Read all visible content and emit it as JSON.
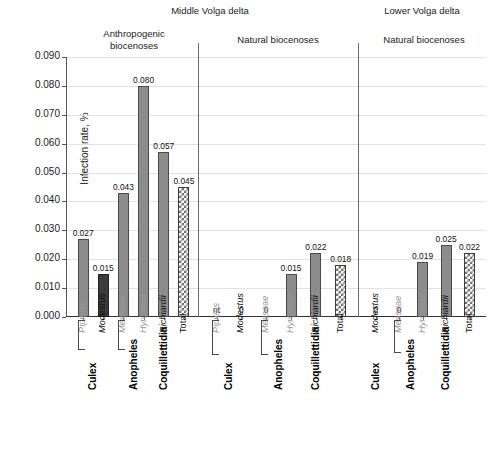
{
  "chart_data": {
    "type": "bar",
    "title": "",
    "xlabel": "",
    "ylabel": "Infection rate, %",
    "ylim": [
      0.0,
      0.09
    ],
    "ytick_labels": [
      "0.000",
      "0.010",
      "0.020",
      "0.030",
      "0.040",
      "0.050",
      "0.060",
      "0.070",
      "0.080",
      "0.090"
    ],
    "ytick_values": [
      0.0,
      0.01,
      0.02,
      0.03,
      0.04,
      0.05,
      0.06,
      0.07,
      0.08,
      0.09
    ],
    "grid": true,
    "legend": "none",
    "regions": [
      {
        "label": "Middle Volga delta"
      },
      {
        "label": "Lower Volga delta"
      }
    ],
    "panels": [
      {
        "title": "Anthropogenic\nbiocenoses",
        "title_line1": "Anthropogenic",
        "title_line2": "biocenoses",
        "region": "Middle Volga delta",
        "categories": [
          "Pipiens",
          "Modestus",
          "Messeae",
          "Hyrcanus",
          "Richiardii",
          "Total"
        ],
        "values": [
          0.027,
          0.015,
          0.043,
          0.08,
          0.057,
          0.045
        ],
        "labels": [
          "0.027",
          "0.015",
          "0.043",
          "0.080",
          "0.057",
          "0.045"
        ],
        "styles": [
          "gray",
          "dark",
          "gray",
          "gray",
          "gray",
          "hatch"
        ],
        "label_styles": [
          "muted-italic",
          "italic",
          "muted-italic",
          "muted-italic",
          "italic",
          "upright"
        ],
        "genera": [
          {
            "name": "Culex",
            "start": 0,
            "end": 1,
            "bracket": true
          },
          {
            "name": "Anopheles",
            "start": 2,
            "end": 3,
            "bracket": true
          },
          {
            "name": "Coquillettidia",
            "start": 4,
            "end": 4,
            "bracket": false
          }
        ]
      },
      {
        "title": "Natural biocenoses",
        "title_line1": "Natural biocenoses",
        "title_line2": "",
        "region": "Middle Volga delta",
        "categories": [
          "Pipiens",
          "Modestus",
          "Messeae",
          "Hyrcanus",
          "Richiardii",
          "Total"
        ],
        "values": [
          null,
          0.0,
          0.0,
          0.015,
          0.022,
          0.018
        ],
        "labels": [
          "nt",
          "0",
          "0",
          "0.015",
          "0.022",
          "0.018"
        ],
        "styles": [
          "none",
          "none",
          "none",
          "gray",
          "gray",
          "hatch"
        ],
        "label_styles": [
          "muted-italic",
          "italic",
          "muted-italic",
          "muted-italic",
          "italic",
          "upright"
        ],
        "genera": [
          {
            "name": "Culex",
            "start": 0,
            "end": 1,
            "bracket": true
          },
          {
            "name": "Anopheles",
            "start": 2,
            "end": 3,
            "bracket": true
          },
          {
            "name": "Coquillettidia",
            "start": 4,
            "end": 4,
            "bracket": false
          }
        ]
      },
      {
        "title": "Natural biocenoses",
        "title_line1": "Natural biocenoses",
        "title_line2": "",
        "region": "Lower Volga delta",
        "categories": [
          "Modestus",
          "Messeae",
          "Hyrcanus",
          "Richiardii",
          "Total"
        ],
        "values": [
          0.0,
          0.0,
          0.019,
          0.025,
          0.022
        ],
        "labels": [
          "0",
          "0",
          "0.019",
          "0.025",
          "0.022"
        ],
        "styles": [
          "none",
          "none",
          "gray",
          "gray",
          "hatch"
        ],
        "label_styles": [
          "italic",
          "muted-italic",
          "muted-italic",
          "italic",
          "upright"
        ],
        "genera": [
          {
            "name": "Culex",
            "start": 0,
            "end": 0,
            "bracket": false
          },
          {
            "name": "Anopheles",
            "start": 1,
            "end": 2,
            "bracket": true
          },
          {
            "name": "Coquillettidia",
            "start": 3,
            "end": 3,
            "bracket": false
          }
        ]
      }
    ],
    "colors": {
      "bar_gray": "#8c8c8c",
      "bar_dark": "#3b3b3b",
      "bar_hatch_fg": "#6e6e6e",
      "bar_hatch_bg": "#ffffff",
      "gridline": "#e2e2e2",
      "axis": "#555555",
      "muted_text": "#9a9a9a",
      "text": "#111111"
    },
    "notes": {
      "nt": "nt = not tested"
    }
  }
}
